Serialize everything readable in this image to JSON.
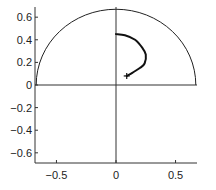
{
  "chart_data": {
    "type": "line",
    "title": "",
    "xlabel": "",
    "ylabel": "",
    "xlim": [
      -0.68,
      0.68
    ],
    "ylim": [
      -0.69,
      0.69
    ],
    "grid": false,
    "legend": null,
    "x_ticks": [
      -0.5,
      0,
      0.5
    ],
    "x_tick_labels": [
      "-0.5",
      "0",
      "0.5"
    ],
    "y_ticks": [
      0.6,
      0.4,
      0.2,
      0,
      -0.2,
      -0.4,
      -0.6
    ],
    "y_tick_labels": [
      "0.6",
      "0.4",
      "0.2",
      "0",
      "-0.2",
      "-0.4",
      "-0.6"
    ],
    "reference_lines": [
      {
        "type": "vertical",
        "x": 0
      },
      {
        "type": "horizontal",
        "y": 0
      }
    ],
    "semicircle": {
      "center": [
        0,
        0
      ],
      "radius": 0.67,
      "half": "upper"
    },
    "series": [
      {
        "name": "trajectory",
        "x": [
          0.0,
          0.075,
          0.16,
          0.22,
          0.25,
          0.24,
          0.2,
          0.14,
          0.09
        ],
        "y": [
          0.45,
          0.44,
          0.4,
          0.33,
          0.27,
          0.19,
          0.15,
          0.11,
          0.08
        ],
        "end_marker": "+",
        "end_point": [
          0.09,
          0.08
        ]
      }
    ]
  },
  "colors": {
    "axis": "#333333",
    "curve": "#111111",
    "circle": "#222222"
  }
}
